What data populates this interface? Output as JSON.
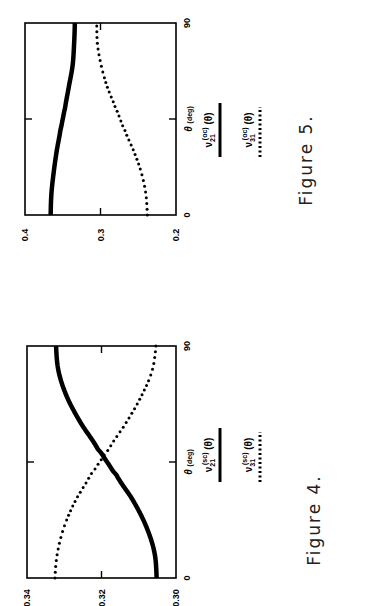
{
  "chart_data": [
    {
      "type": "line",
      "orientation": "rotated 90 degrees counter-clockwise",
      "title": "Figure 5.",
      "xlabel": "θ",
      "xlabel_unit": "(deg)",
      "ylabel": "",
      "xlim": [
        0,
        90
      ],
      "ylim": [
        0.2,
        0.4
      ],
      "x_ticks": [
        "0",
        "90"
      ],
      "y_ticks": [
        "0.2",
        "0.3",
        "0.4"
      ],
      "x_minor_tick": 45,
      "grid": false,
      "legend_placement": "right of plot",
      "x": [
        0,
        10,
        20,
        30,
        40,
        45,
        50,
        60,
        70,
        80,
        90
      ],
      "series": [
        {
          "name": "ν21(oc)(θ)",
          "legend_base": "ν",
          "legend_sub": "21",
          "legend_sup": "(oc)",
          "legend_arg": " (θ)",
          "style": "solid",
          "values": [
            0.366,
            0.365,
            0.362,
            0.358,
            0.353,
            0.35,
            0.347,
            0.342,
            0.337,
            0.335,
            0.334
          ]
        },
        {
          "name": "ν31(oc)(θ)",
          "legend_base": "ν",
          "legend_sub": "31",
          "legend_sup": "(oc)",
          "legend_arg": " (θ)",
          "style": "dotted",
          "values": [
            0.238,
            0.24,
            0.246,
            0.256,
            0.268,
            0.274,
            0.28,
            0.291,
            0.299,
            0.304,
            0.305
          ]
        }
      ]
    },
    {
      "type": "line",
      "orientation": "rotated 90 degrees counter-clockwise",
      "title": "Figure 4.",
      "xlabel": "θ",
      "xlabel_unit": "(deg)",
      "ylabel": "",
      "xlim": [
        0,
        90
      ],
      "ylim": [
        0.3,
        0.34
      ],
      "x_ticks": [
        "0",
        "90"
      ],
      "y_ticks": [
        "0.30",
        "0.32",
        "0.34"
      ],
      "x_minor_tick": 45,
      "grid": false,
      "legend_placement": "right of plot",
      "x": [
        0,
        10,
        20,
        30,
        40,
        45,
        50,
        60,
        70,
        80,
        90
      ],
      "series": [
        {
          "name": "ν21(sc)(θ)",
          "legend_base": "ν",
          "legend_sub": "21",
          "legend_sup": "(sc)",
          "legend_arg": " (θ)",
          "style": "solid",
          "values": [
            0.3052,
            0.3058,
            0.308,
            0.3115,
            0.316,
            0.3185,
            0.321,
            0.3255,
            0.3292,
            0.3315,
            0.3322
          ]
        },
        {
          "name": "ν31(sc)(θ)",
          "legend_base": "ν",
          "legend_sub": "31",
          "legend_sup": "(sc)",
          "legend_arg": " (θ)",
          "style": "dotted",
          "values": [
            0.3325,
            0.3318,
            0.33,
            0.327,
            0.323,
            0.3205,
            0.318,
            0.3135,
            0.3095,
            0.3065,
            0.3054
          ]
        }
      ]
    }
  ]
}
